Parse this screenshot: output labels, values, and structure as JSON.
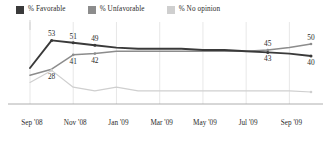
{
  "legend": {
    "position": "top-left",
    "items": [
      {
        "label": "% Favorable",
        "color": "#3a3a3a",
        "key": "favorable"
      },
      {
        "label": "% Unfavorable",
        "color": "#8c8c8c",
        "key": "unfavorable"
      },
      {
        "label": "% No opinion",
        "color": "#cfcfcf",
        "key": "no_opinion"
      }
    ]
  },
  "chart_data": {
    "type": "line",
    "title": "",
    "subtitle": "",
    "xlabel": "",
    "ylabel": "",
    "grid": true,
    "ylim": [
      0,
      60
    ],
    "xtick_labels": [
      "Sep '08",
      "Nov '08",
      "Jan '09",
      "Mar '09",
      "May '09",
      "Jul '09",
      "Sep '09"
    ],
    "x": [
      0,
      1,
      2,
      3,
      4,
      5,
      6,
      7,
      8,
      9,
      10,
      11,
      12,
      13
    ],
    "series": [
      {
        "name": "% Favorable",
        "color": "#3a3a3a",
        "values": [
          30,
          53,
          51,
          49,
          47,
          46,
          46,
          46,
          45,
          45,
          44,
          43,
          42,
          40
        ],
        "labels": [
          {
            "x": 1,
            "value": 53,
            "text": "53",
            "pos": "above"
          },
          {
            "x": 2,
            "value": 51,
            "text": "51",
            "pos": "above"
          },
          {
            "x": 3,
            "value": 49,
            "text": "49",
            "pos": "above"
          },
          {
            "x": 11,
            "value": 43,
            "text": "43",
            "pos": "below"
          },
          {
            "x": 13,
            "value": 40,
            "text": "40",
            "pos": "below"
          }
        ]
      },
      {
        "name": "% Unfavorable",
        "color": "#8c8c8c",
        "values": [
          24,
          29,
          41,
          42,
          44,
          44,
          44,
          44,
          44,
          44,
          44,
          45,
          47,
          50
        ],
        "labels": [
          {
            "x": 2,
            "value": 41,
            "text": "41",
            "pos": "below"
          },
          {
            "x": 3,
            "value": 42,
            "text": "42",
            "pos": "below"
          },
          {
            "x": 11,
            "value": 45,
            "text": "45",
            "pos": "above"
          },
          {
            "x": 13,
            "value": 50,
            "text": "50",
            "pos": "above"
          }
        ]
      },
      {
        "name": "% No opinion",
        "color": "#cfcfcf",
        "values": [
          18,
          28,
          14,
          11,
          14,
          11,
          11,
          11,
          11,
          11,
          11,
          11,
          11,
          10
        ],
        "labels": [
          {
            "x": 1,
            "value": 28,
            "text": "28",
            "pos": "below"
          }
        ]
      }
    ]
  }
}
